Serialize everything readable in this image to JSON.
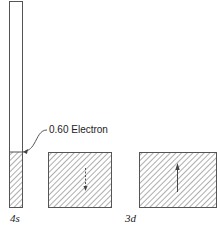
{
  "diagram": {
    "annotation": "0.60 Electron",
    "orbital_labels": {
      "s": "4s",
      "d": "3d"
    },
    "orbitals": [
      {
        "name": "4s",
        "fill_fraction": 0.27,
        "spin_arrow": "none"
      },
      {
        "name": "3d-a",
        "filled": true,
        "spin_arrow": "down"
      },
      {
        "name": "3d-b",
        "filled": true,
        "spin_arrow": "up"
      }
    ],
    "colors": {
      "line": "#555555",
      "hatch": "#777777",
      "background": "#ffffff"
    }
  }
}
